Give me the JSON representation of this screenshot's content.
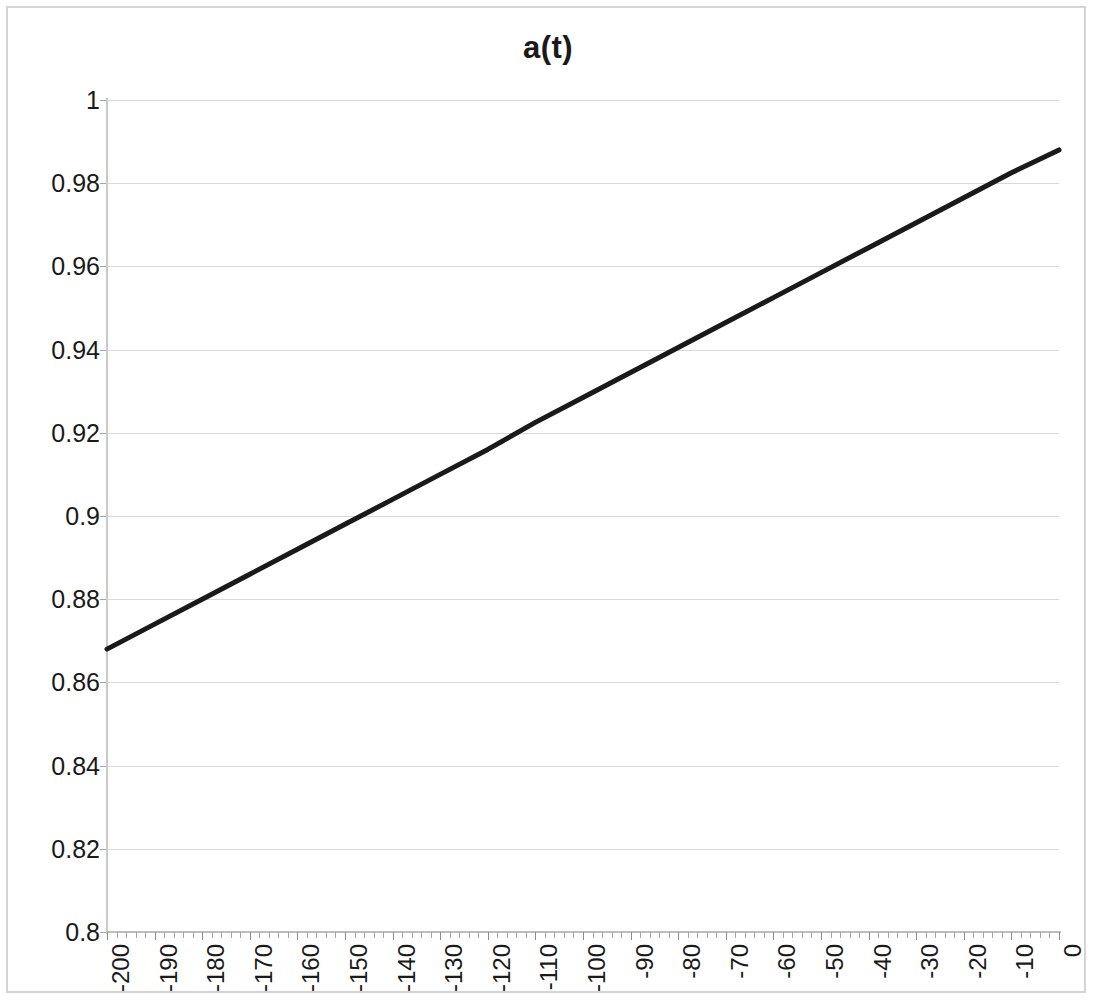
{
  "chart": {
    "title": "a(t)",
    "background_color": "#ffffff",
    "border_color": "#d4d4d4",
    "gridline_color": "#d9d9d9",
    "series_color": "#1a1a1a"
  },
  "chart_data": {
    "type": "line",
    "title": "a(t)",
    "xlabel": "",
    "ylabel": "",
    "xlim": [
      -200,
      0
    ],
    "ylim": [
      0.8,
      1
    ],
    "grid": "horizontal",
    "legend": "none",
    "x_tick_labels": [
      "-200",
      "-190",
      "-180",
      "-170",
      "-160",
      "-150",
      "-140",
      "-130",
      "-120",
      "-110",
      "-100",
      "-90",
      "-80",
      "-70",
      "-60",
      "-50",
      "-40",
      "-30",
      "-20",
      "-10",
      "0"
    ],
    "x_ticks": [
      -200,
      -190,
      -180,
      -170,
      -160,
      -150,
      -140,
      -130,
      -120,
      -110,
      -100,
      -90,
      -80,
      -70,
      -60,
      -50,
      -40,
      -30,
      -20,
      -10,
      0
    ],
    "x_minor_tick_step": 2,
    "y_tick_labels": [
      "0.8",
      "0.82",
      "0.84",
      "0.86",
      "0.88",
      "0.9",
      "0.92",
      "0.94",
      "0.96",
      "0.98",
      "1"
    ],
    "y_ticks": [
      0.8,
      0.82,
      0.84,
      0.86,
      0.88,
      0.9,
      0.92,
      0.94,
      0.96,
      0.98,
      1
    ],
    "series": [
      {
        "name": "a(t)",
        "color": "#1a1a1a",
        "line_width": 5,
        "x": [
          -200,
          -190,
          -180,
          -170,
          -160,
          -150,
          -140,
          -130,
          -120,
          -110,
          -100,
          -90,
          -80,
          -70,
          -60,
          -50,
          -40,
          -30,
          -20,
          -10,
          0
        ],
        "values": [
          0.868,
          0.874,
          0.88,
          0.886,
          0.892,
          0.898,
          0.904,
          0.91,
          0.916,
          0.9225,
          0.9285,
          0.9345,
          0.9405,
          0.9465,
          0.9525,
          0.9585,
          0.9645,
          0.9705,
          0.9765,
          0.9825,
          0.988
        ]
      }
    ]
  }
}
